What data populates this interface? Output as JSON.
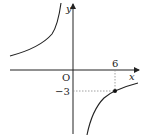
{
  "diagram": {
    "type": "inverse-proportion-graph",
    "function": "y = k/x",
    "axes": {
      "x_label": "x",
      "y_label": "y",
      "origin_label": "O"
    },
    "point": {
      "x": 6,
      "y": -3,
      "x_tick_label": "6",
      "y_tick_label": "−3"
    },
    "k": -18,
    "colors": {
      "curve": "#222222",
      "axis": "#222222",
      "guide": "#888888",
      "point": "#111111"
    }
  }
}
